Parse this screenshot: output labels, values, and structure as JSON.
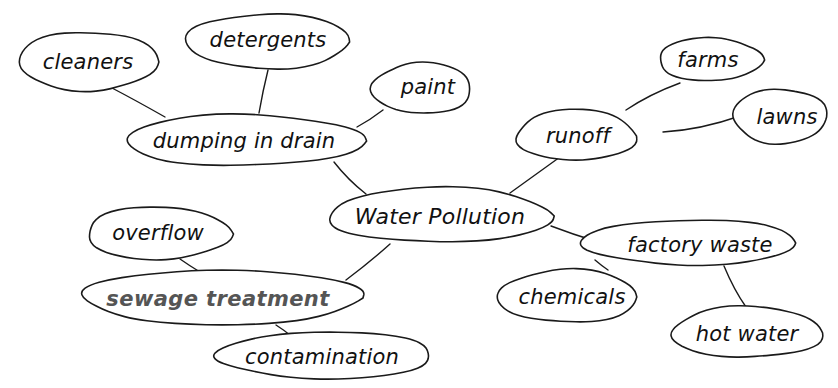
{
  "diagram": {
    "title": "Water Pollution",
    "type": "mind-map",
    "colors": {
      "stroke": "#1a1a1a",
      "text": "#111111",
      "muted_text": "#555555",
      "background": "#ffffff"
    },
    "nodes": [
      {
        "id": "water_pollution",
        "label": "Water Pollution",
        "cx": 440,
        "cy": 216,
        "rx": 112,
        "ry": 28,
        "style": "center"
      },
      {
        "id": "dumping_in_drain",
        "label": "dumping in drain",
        "cx": 244,
        "cy": 141,
        "rx": 120,
        "ry": 26,
        "style": "normal"
      },
      {
        "id": "cleaners",
        "label": "cleaners",
        "cx": 88,
        "cy": 62,
        "rx": 70,
        "ry": 30,
        "style": "normal"
      },
      {
        "id": "detergents",
        "label": "detergents",
        "cx": 268,
        "cy": 42,
        "rx": 82,
        "ry": 28,
        "style": "normal"
      },
      {
        "id": "paint",
        "label": "paint",
        "cx": 422,
        "cy": 89,
        "rx": 50,
        "ry": 26,
        "style": "normal"
      },
      {
        "id": "runoff",
        "label": "runoff",
        "cx": 576,
        "cy": 136,
        "rx": 60,
        "ry": 26,
        "style": "normal"
      },
      {
        "id": "farms",
        "label": "farms",
        "cx": 710,
        "cy": 60,
        "rx": 52,
        "ry": 22,
        "style": "normal"
      },
      {
        "id": "lawns",
        "label": "lawns",
        "cx": 780,
        "cy": 117,
        "rx": 47,
        "ry": 28,
        "style": "normal"
      },
      {
        "id": "factory_waste",
        "label": "factory waste",
        "cx": 690,
        "cy": 243,
        "rx": 108,
        "ry": 23,
        "style": "normal"
      },
      {
        "id": "chemicals",
        "label": "chemicals",
        "cx": 568,
        "cy": 297,
        "rx": 70,
        "ry": 27,
        "style": "normal"
      },
      {
        "id": "hot_water",
        "label": "hot water",
        "cx": 747,
        "cy": 333,
        "rx": 76,
        "ry": 26,
        "style": "normal"
      },
      {
        "id": "overflow",
        "label": "overflow",
        "cx": 158,
        "cy": 234,
        "rx": 72,
        "ry": 27,
        "style": "normal"
      },
      {
        "id": "sewage_treatment",
        "label": "sewage treatment",
        "cx": 222,
        "cy": 298,
        "rx": 140,
        "ry": 28,
        "style": "muted"
      },
      {
        "id": "contamination",
        "label": "contamination",
        "cx": 326,
        "cy": 356,
        "rx": 108,
        "ry": 24,
        "style": "normal"
      }
    ],
    "edges": [
      {
        "from": "water_pollution",
        "to": "dumping_in_drain",
        "path": "M 366 194 Q 348 180 334 162"
      },
      {
        "from": "dumping_in_drain",
        "to": "cleaners",
        "path": "M 165 117 Q 135 100 112 88"
      },
      {
        "from": "dumping_in_drain",
        "to": "detergents",
        "path": "M 259 113 Q 263 90 268 70"
      },
      {
        "from": "dumping_in_drain",
        "to": "paint",
        "path": "M 357 127 Q 370 120 383 110"
      },
      {
        "from": "water_pollution",
        "to": "runoff",
        "path": "M 510 193 Q 535 175 560 157"
      },
      {
        "from": "runoff",
        "to": "farms",
        "path": "M 626 110 Q 650 94 680 83"
      },
      {
        "from": "runoff",
        "to": "lawns",
        "path": "M 663 132 Q 700 130 740 116"
      },
      {
        "from": "water_pollution",
        "to": "factory_waste",
        "path": "M 551 226 Q 572 234 595 241"
      },
      {
        "from": "factory_waste",
        "to": "chemicals",
        "path": "M 595 260 Q 602 266 608 270"
      },
      {
        "from": "factory_waste",
        "to": "hot_water",
        "path": "M 724 266 Q 734 290 746 307"
      },
      {
        "from": "water_pollution",
        "to": "sewage_treatment",
        "path": "M 390 244 Q 370 262 346 280"
      },
      {
        "from": "sewage_treatment",
        "to": "overflow",
        "path": "M 200 272 Q 190 266 180 259"
      },
      {
        "from": "sewage_treatment",
        "to": "contamination",
        "path": "M 276 325 Q 284 330 291 336"
      }
    ]
  }
}
